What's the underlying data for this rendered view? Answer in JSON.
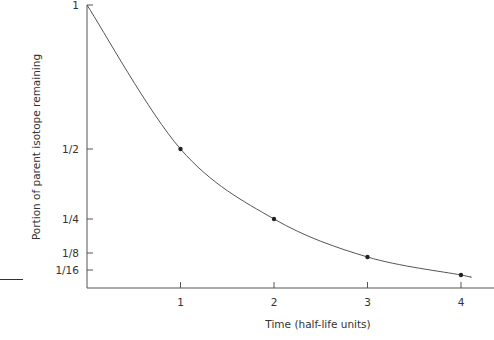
{
  "chart_data": {
    "type": "line",
    "title": "",
    "xlabel": "Time (half-life units)",
    "ylabel": "Portion of parent isotope remaining",
    "x_ticks": [
      "1",
      "2",
      "3",
      "4"
    ],
    "y_ticks": [
      "1",
      "1/2",
      "1/4",
      "1/8",
      "1/16"
    ],
    "xlim": [
      0,
      4.3
    ],
    "ylim": [
      0,
      1
    ],
    "grid": false,
    "legend": null,
    "series": [
      {
        "name": "Radioactive decay curve",
        "x": [
          0,
          1,
          2,
          3,
          4
        ],
        "y": [
          1,
          0.5,
          0.25,
          0.125,
          0.0625
        ],
        "markers_at": [
          1,
          2,
          3,
          4
        ]
      }
    ]
  }
}
